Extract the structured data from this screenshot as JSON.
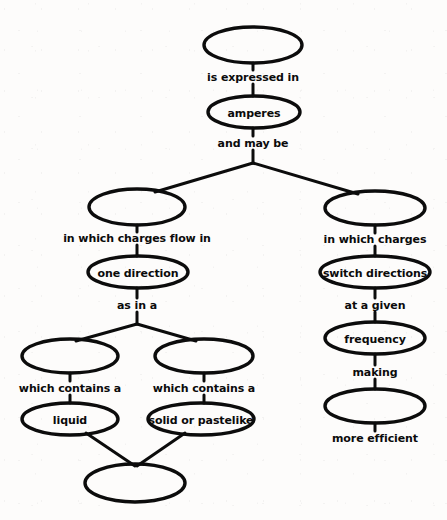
{
  "diagram": {
    "type": "concept-map",
    "ink_color": "#0c0c0c",
    "background_color": "#fdfcfb",
    "nodes": [
      {
        "id": "n1",
        "label": "",
        "cx": 253,
        "cy": 45,
        "rx": 49,
        "ry": 18
      },
      {
        "id": "n2",
        "label": "amperes",
        "cx": 254,
        "cy": 112,
        "rx": 46,
        "ry": 16
      },
      {
        "id": "n3",
        "label": "",
        "cx": 137,
        "cy": 207,
        "rx": 48,
        "ry": 18
      },
      {
        "id": "n4",
        "label": "",
        "cx": 375,
        "cy": 208,
        "rx": 50,
        "ry": 17
      },
      {
        "id": "n5",
        "label": "one direction",
        "cx": 138,
        "cy": 272,
        "rx": 50,
        "ry": 16
      },
      {
        "id": "n6",
        "label": "switch directions",
        "cx": 375,
        "cy": 272,
        "rx": 55,
        "ry": 16
      },
      {
        "id": "n7",
        "label": "frequency",
        "cx": 375,
        "cy": 338,
        "rx": 50,
        "ry": 16
      },
      {
        "id": "n8",
        "label": "",
        "cx": 375,
        "cy": 406,
        "rx": 50,
        "ry": 17
      },
      {
        "id": "n9",
        "label": "",
        "cx": 70,
        "cy": 356,
        "rx": 48,
        "ry": 17
      },
      {
        "id": "n10",
        "label": "",
        "cx": 204,
        "cy": 356,
        "rx": 49,
        "ry": 17
      },
      {
        "id": "n11",
        "label": "liquid",
        "cx": 70,
        "cy": 419,
        "rx": 48,
        "ry": 16
      },
      {
        "id": "n12",
        "label": "solid or pastelike",
        "cx": 201,
        "cy": 419,
        "rx": 53,
        "ry": 16
      },
      {
        "id": "n13",
        "label": "",
        "cx": 135,
        "cy": 483,
        "rx": 50,
        "ry": 19
      }
    ],
    "link_labels": [
      {
        "id": "l1",
        "text": "is expressed in",
        "x": 253,
        "y": 77
      },
      {
        "id": "l2",
        "text": "and may be",
        "x": 253,
        "y": 143
      },
      {
        "id": "l3",
        "text": "in which charges flow in",
        "x": 137,
        "y": 238
      },
      {
        "id": "l4",
        "text": "in which charges",
        "x": 375,
        "y": 239
      },
      {
        "id": "l5",
        "text": "as in a",
        "x": 137,
        "y": 305
      },
      {
        "id": "l6",
        "text": "at a given",
        "x": 375,
        "y": 305
      },
      {
        "id": "l7",
        "text": "making",
        "x": 375,
        "y": 372
      },
      {
        "id": "l8",
        "text": "more efficient",
        "x": 375,
        "y": 438
      },
      {
        "id": "l9",
        "text": "which contains a",
        "x": 70,
        "y": 388
      },
      {
        "id": "l10",
        "text": "which contains a",
        "x": 204,
        "y": 388
      }
    ],
    "edges": [
      {
        "id": "e1",
        "from": "n1",
        "to": "l1",
        "path": "M 253 63 L 253 70"
      },
      {
        "id": "e2",
        "from": "l1",
        "to": "n2",
        "path": "M 253 84 L 253 96"
      },
      {
        "id": "e3",
        "from": "n2",
        "to": "l2",
        "path": "M 253 128 L 253 136"
      },
      {
        "id": "e4",
        "from": "l2",
        "to": "branch",
        "path": "M 253 150 L 253 163"
      },
      {
        "id": "e5",
        "from": "branch",
        "to": "n3",
        "path": "M 253 163 L 155 192"
      },
      {
        "id": "e6",
        "from": "branch",
        "to": "n4",
        "path": "M 253 163 L 358 194"
      },
      {
        "id": "e7",
        "from": "n3",
        "to": "l3",
        "path": "M 137 225 L 137 232"
      },
      {
        "id": "e8",
        "from": "l3",
        "to": "n5",
        "path": "M 137 245 L 137 256"
      },
      {
        "id": "e9",
        "from": "n5",
        "to": "l5",
        "path": "M 137 288 L 137 298"
      },
      {
        "id": "e10",
        "from": "l5",
        "to": "split",
        "path": "M 137 312 L 137 324"
      },
      {
        "id": "e11",
        "from": "split",
        "to": "n9",
        "path": "M 137 324 L 76 341"
      },
      {
        "id": "e12",
        "from": "split",
        "to": "n10",
        "path": "M 137 324 L 196 341"
      },
      {
        "id": "e13",
        "from": "n9",
        "to": "l9",
        "path": "M 70 373 L 70 381"
      },
      {
        "id": "e14",
        "from": "l9",
        "to": "n11",
        "path": "M 70 395 L 70 403"
      },
      {
        "id": "e15",
        "from": "n10",
        "to": "l10",
        "path": "M 204 373 L 204 381"
      },
      {
        "id": "e16",
        "from": "l10",
        "to": "n12",
        "path": "M 204 395 L 204 403"
      },
      {
        "id": "e17",
        "from": "n11",
        "to": "n13",
        "path": "M 86 433 L 135 466"
      },
      {
        "id": "e18",
        "from": "n12",
        "to": "n13",
        "path": "M 185 433 L 137 466"
      },
      {
        "id": "e19",
        "from": "n4",
        "to": "l4",
        "path": "M 375 225 L 375 233"
      },
      {
        "id": "e20",
        "from": "l4",
        "to": "n6",
        "path": "M 375 246 L 375 256"
      },
      {
        "id": "e21",
        "from": "n6",
        "to": "l6",
        "path": "M 375 288 L 375 298"
      },
      {
        "id": "e22",
        "from": "l6",
        "to": "n7",
        "path": "M 375 312 L 375 322"
      },
      {
        "id": "e23",
        "from": "n7",
        "to": "l7",
        "path": "M 375 354 L 375 365"
      },
      {
        "id": "e24",
        "from": "l7",
        "to": "n8",
        "path": "M 375 379 L 375 389"
      },
      {
        "id": "e25",
        "from": "n8",
        "to": "l8",
        "path": "M 375 423 L 375 431"
      }
    ]
  }
}
